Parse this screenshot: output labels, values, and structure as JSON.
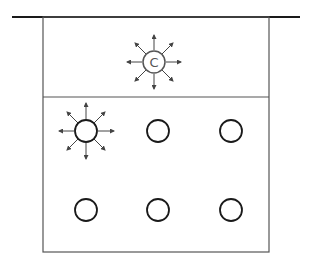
{
  "diagram": {
    "title": "",
    "center_label": "C",
    "colors": {
      "stroke": "#1a1a1a",
      "ray": "#444444",
      "background": "#ffffff"
    },
    "top_compartment": {
      "emitting_particle": {
        "label": "C",
        "x": 154,
        "y": 62
      }
    },
    "bottom_compartment": {
      "particles": [
        {
          "x": 86,
          "y": 131,
          "emitting": true
        },
        {
          "x": 158,
          "y": 131,
          "emitting": false
        },
        {
          "x": 231,
          "y": 131,
          "emitting": false
        },
        {
          "x": 86,
          "y": 210,
          "emitting": false
        },
        {
          "x": 158,
          "y": 210,
          "emitting": false
        },
        {
          "x": 231,
          "y": 210,
          "emitting": false
        }
      ]
    }
  }
}
